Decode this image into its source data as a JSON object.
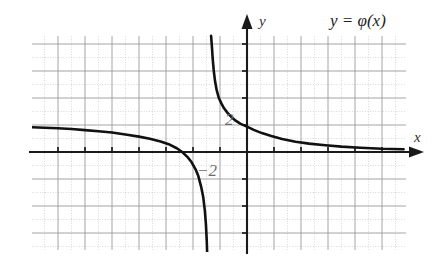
{
  "figure": {
    "title_label": "y = φ(x)",
    "axis_x_label": "x",
    "axis_y_label": "y",
    "tick_label_positive": "2",
    "tick_label_negative": "−2",
    "colors": {
      "background": "#ffffff",
      "curve": "#111111",
      "axis": "#1a1a1a",
      "grid_major": "#9a9a9a",
      "grid_minor": "#c9c9c9",
      "label": "#555555"
    }
  },
  "chart_data": {
    "type": "line",
    "title": "y = φ(x)",
    "xlabel": "x",
    "ylabel": "y",
    "grid": true,
    "legend": "none",
    "xlim": [
      -8,
      6
    ],
    "ylim": [
      -4.3,
      4.3
    ],
    "x_major_step": 1,
    "y_major_step": 1,
    "annotations": [
      {
        "text": "2",
        "x": -0.45,
        "y": 2.0,
        "note": "y-intercept tick label"
      },
      {
        "text": "−2",
        "x": -0.95,
        "y": -0.72,
        "note": "label below x-axis"
      },
      {
        "text": "y = φ(x)",
        "x": 3.6,
        "y": 4.0,
        "note": "function label top right"
      }
    ],
    "asymptotes": {
      "vertical": -1.4,
      "horizontal": 0
    },
    "series": [
      {
        "name": "left-branch",
        "comment": "branch left of vertical asymptote x=-1.4, decreasing toward -infinity",
        "x": [
          -8.0,
          -7.5,
          -7.0,
          -6.5,
          -6.0,
          -5.5,
          -5.0,
          -4.5,
          -4.0,
          -3.6,
          -3.2,
          -2.9,
          -2.6,
          -2.4,
          -2.2,
          -2.05,
          -1.9,
          -1.8,
          -1.7,
          -1.62,
          -1.56,
          -1.52,
          -1.49,
          -1.47
        ],
        "y": [
          0.92,
          0.9,
          0.88,
          0.85,
          0.81,
          0.77,
          0.72,
          0.65,
          0.57,
          0.49,
          0.39,
          0.29,
          0.14,
          0.0,
          -0.19,
          -0.38,
          -0.65,
          -0.9,
          -1.28,
          -1.68,
          -2.18,
          -2.7,
          -3.3,
          -3.9
        ]
      },
      {
        "name": "right-branch",
        "comment": "branch right of vertical asymptote, decreasing from +infinity toward 0",
        "x": [
          -1.33,
          -1.3,
          -1.27,
          -1.23,
          -1.18,
          -1.12,
          -1.05,
          -0.95,
          -0.85,
          -0.72,
          -0.58,
          -0.42,
          -0.25,
          -0.05,
          0.0,
          0.25,
          0.55,
          0.9,
          1.3,
          1.8,
          2.3,
          2.9,
          3.5,
          4.2,
          5.0,
          5.8
        ],
        "y": [
          4.3,
          3.9,
          3.45,
          3.0,
          2.6,
          2.28,
          2.02,
          1.8,
          1.62,
          1.45,
          1.3,
          1.16,
          1.05,
          0.96,
          0.94,
          0.82,
          0.7,
          0.59,
          0.48,
          0.38,
          0.31,
          0.25,
          0.2,
          0.16,
          0.12,
          0.1
        ]
      }
    ]
  }
}
